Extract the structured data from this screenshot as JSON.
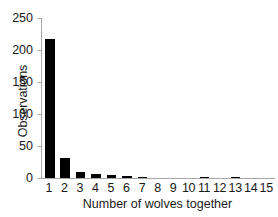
{
  "chart_data": {
    "type": "bar",
    "title": "",
    "xlabel": "Number of wolves together",
    "ylabel": "Observations",
    "categories": [
      "1",
      "2",
      "3",
      "4",
      "5",
      "6",
      "7",
      "8",
      "9",
      "10",
      "11",
      "12",
      "13",
      "14",
      "15"
    ],
    "values": [
      217,
      32,
      10,
      7,
      5,
      3,
      2,
      0,
      0,
      0,
      1,
      0,
      1,
      0,
      0
    ],
    "ylim": [
      0,
      250
    ],
    "yticks": [
      0,
      50,
      100,
      150,
      200,
      250
    ],
    "ytick_labels": [
      "0",
      "50",
      "100",
      "150",
      "200",
      "250"
    ],
    "grid": false,
    "legend": false,
    "bar_color": "#000000",
    "axis_color": "#a8a8a8",
    "background_color": "#ffffff"
  }
}
